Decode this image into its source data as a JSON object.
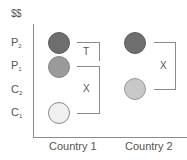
{
  "axis": {
    "y_title": "$$",
    "y_ticks": [
      {
        "main": "P",
        "sub": "2"
      },
      {
        "main": "P",
        "sub": "1"
      },
      {
        "main": "C",
        "sub": "2"
      },
      {
        "main": "C",
        "sub": "1"
      }
    ],
    "x_categories": [
      "Country 1",
      "Country 2"
    ]
  },
  "country1": {
    "points": [
      {
        "level": "P2",
        "color": "#6e6e6e",
        "border": "#5c5c5c"
      },
      {
        "level": "P1",
        "color": "#9a9a9a",
        "border": "#858585"
      },
      {
        "level": "C1",
        "color": "#f0f0f0",
        "border": "#8a8a8a"
      }
    ],
    "brackets": [
      {
        "label": "T",
        "from": "P2",
        "to": "P1"
      },
      {
        "label": "X",
        "from": "P1",
        "to": "C1"
      }
    ]
  },
  "country2": {
    "points": [
      {
        "level": "P2",
        "color": "#6e6e6e",
        "border": "#5c5c5c"
      },
      {
        "level": "C2",
        "color": "#c8c8c8",
        "border": "#9a9a9a"
      }
    ],
    "brackets": [
      {
        "label": "X",
        "from": "P2",
        "to": "C2"
      }
    ]
  }
}
